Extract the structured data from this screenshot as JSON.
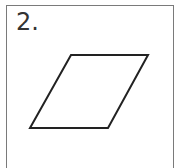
{
  "problem": {
    "number_label": "2.",
    "shape": {
      "name": "parallelogram",
      "vertices": [
        [
          71,
          55
        ],
        [
          148,
          55
        ],
        [
          108,
          128
        ],
        [
          30,
          128
        ]
      ],
      "stroke": "#222222",
      "stroke_width": 2
    },
    "border_color": "#7a7a7a"
  }
}
